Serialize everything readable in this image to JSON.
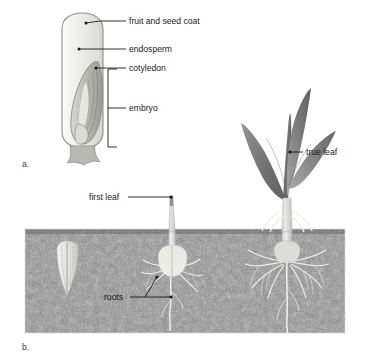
{
  "figure": {
    "title_semantic": "monocot-seed-structure-and-germination",
    "panels": [
      {
        "id": "a",
        "label": "a.",
        "subject": "corn grain internal structure"
      },
      {
        "id": "b",
        "label": "b.",
        "subject": "corn seedling germination stages"
      }
    ]
  },
  "panel_a": {
    "marker": "a.",
    "labels": [
      {
        "name": "fruit-and-seed-coat",
        "text": "fruit and seed coat"
      },
      {
        "name": "endosperm",
        "text": "endosperm"
      },
      {
        "name": "cotyledon",
        "text": "cotyledon"
      },
      {
        "name": "embryo",
        "text": "embryo"
      }
    ]
  },
  "panel_b": {
    "marker": "b.",
    "labels": [
      {
        "name": "first-leaf",
        "text": "first leaf"
      },
      {
        "name": "roots",
        "text": "roots"
      },
      {
        "name": "true-leaf",
        "text": "true leaf"
      }
    ],
    "stages": [
      {
        "name": "stage-ungerminated-seed"
      },
      {
        "name": "stage-emerging-seedling"
      },
      {
        "name": "stage-established-plant"
      }
    ]
  },
  "colors": {
    "background": "#ffffff",
    "soil": "#8b8b8b",
    "soil_dark": "#6f6f6f",
    "seed_coat": "#e9e9e6",
    "seed_outline": "#8a8a86",
    "endosperm": "#ececea",
    "embryo": "#bdbdb8",
    "leaf_dark": "#6e6e6e",
    "leaf_light": "#a8a8a8",
    "shoot": "#e2e2de",
    "root": "#efefec",
    "label_text": "#1a1a1a",
    "leader_line": "#1a1a1a"
  }
}
